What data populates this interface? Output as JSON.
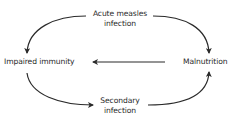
{
  "diagram": {
    "type": "cycle",
    "nodes": {
      "top": {
        "line1": "Acute measles",
        "line2": "infection"
      },
      "left": {
        "label": "Impaired immunity"
      },
      "right": {
        "label": "Malnutrition"
      },
      "bottom": {
        "line1": "Secondary",
        "line2": "infection"
      }
    },
    "edges": [
      {
        "from": "Acute measles infection",
        "to": "Impaired immunity"
      },
      {
        "from": "Acute measles infection",
        "to": "Malnutrition"
      },
      {
        "from": "Malnutrition",
        "to": "Impaired immunity"
      },
      {
        "from": "Impaired immunity",
        "to": "Secondary infection"
      },
      {
        "from": "Secondary infection",
        "to": "Malnutrition"
      }
    ],
    "colors": {
      "arrow": "#2a2a2a",
      "text": "#2a2a2a",
      "background": "#ffffff"
    }
  }
}
